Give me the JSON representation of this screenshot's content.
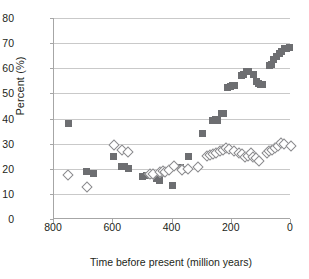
{
  "chart_data": {
    "type": "scatter",
    "title": "",
    "xlabel": "Time before present (million years)",
    "ylabel": "Percent (%)",
    "xlim": [
      800,
      0
    ],
    "ylim": [
      0,
      80
    ],
    "x_reversed": true,
    "grid": "horizontal",
    "legend": "none",
    "xticks": [
      800,
      600,
      400,
      200,
      0
    ],
    "yticks": [
      0,
      10,
      20,
      30,
      40,
      50,
      60,
      70,
      80
    ],
    "colors": {
      "square_series": "#6d6e71",
      "diamond_series": "#8a8a8d",
      "gridline": "#c9c9c9",
      "axis": "#a6a6a6",
      "text": "#231f20",
      "background": "#ffffff"
    },
    "series": [
      {
        "name": "filled-squares",
        "marker": "square",
        "points": [
          [
            750,
            38.0
          ],
          [
            690,
            19.0
          ],
          [
            665,
            18.0
          ],
          [
            600,
            25.0
          ],
          [
            573,
            21.0
          ],
          [
            562,
            21.0
          ],
          [
            548,
            20.2
          ],
          [
            500,
            17.0
          ],
          [
            487,
            17.2
          ],
          [
            468,
            17.4
          ],
          [
            455,
            16.2
          ],
          [
            445,
            15.5
          ],
          [
            437,
            18.0
          ],
          [
            430,
            18.5
          ],
          [
            400,
            13.3
          ],
          [
            372,
            20.5
          ],
          [
            365,
            19.8
          ],
          [
            345,
            25.0
          ],
          [
            300,
            34.2
          ],
          [
            265,
            39.2
          ],
          [
            255,
            39.5
          ],
          [
            247,
            39.3
          ],
          [
            233,
            42.0
          ],
          [
            228,
            41.8
          ],
          [
            215,
            52.5
          ],
          [
            205,
            52.7
          ],
          [
            197,
            53.2
          ],
          [
            192,
            53.0
          ],
          [
            168,
            57.2
          ],
          [
            160,
            57.5
          ],
          [
            150,
            58.7
          ],
          [
            143,
            58.8
          ],
          [
            128,
            57.5
          ],
          [
            118,
            54.8
          ],
          [
            110,
            54.0
          ],
          [
            103,
            53.5
          ],
          [
            95,
            53.4
          ],
          [
            72,
            61.2
          ],
          [
            66,
            61.5
          ],
          [
            58,
            63.5
          ],
          [
            50,
            64.5
          ],
          [
            40,
            66.0
          ],
          [
            32,
            66.5
          ],
          [
            22,
            67.8
          ],
          [
            14,
            68.0
          ],
          [
            6,
            68.2
          ]
        ]
      },
      {
        "name": "open-diamonds",
        "marker": "diamond",
        "points": [
          [
            755,
            18.0
          ],
          [
            693,
            13.0
          ],
          [
            600,
            30.0
          ],
          [
            575,
            28.0
          ],
          [
            553,
            27.0
          ],
          [
            478,
            18.5
          ],
          [
            470,
            18.2
          ],
          [
            447,
            19.3
          ],
          [
            437,
            19.5
          ],
          [
            428,
            19.2
          ],
          [
            415,
            20.0
          ],
          [
            398,
            21.3
          ],
          [
            372,
            20.0
          ],
          [
            350,
            20.2
          ],
          [
            318,
            21.2
          ],
          [
            288,
            25.5
          ],
          [
            278,
            25.8
          ],
          [
            268,
            26.2
          ],
          [
            255,
            26.5
          ],
          [
            243,
            27.5
          ],
          [
            232,
            27.8
          ],
          [
            222,
            28.5
          ],
          [
            212,
            28.3
          ],
          [
            196,
            27.5
          ],
          [
            178,
            26.5
          ],
          [
            170,
            26.2
          ],
          [
            160,
            25.2
          ],
          [
            150,
            25.4
          ],
          [
            140,
            26.5
          ],
          [
            130,
            25.0
          ],
          [
            120,
            24.5
          ],
          [
            112,
            23.3
          ],
          [
            86,
            26.5
          ],
          [
            76,
            27.5
          ],
          [
            66,
            28.0
          ],
          [
            56,
            28.5
          ],
          [
            46,
            29.5
          ],
          [
            36,
            30.5
          ],
          [
            26,
            30.2
          ],
          [
            5,
            29.5
          ]
        ]
      }
    ]
  }
}
